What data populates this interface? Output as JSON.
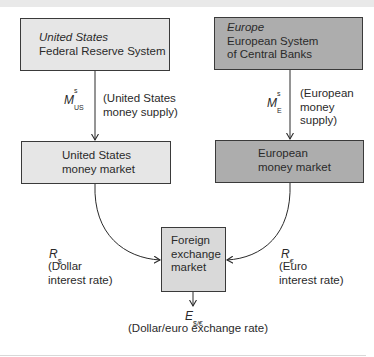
{
  "boxes": {
    "us_fed": {
      "region": "United States",
      "name": "Federal Reserve System"
    },
    "europe_escb": {
      "region": "Europe",
      "name_line1": "European System",
      "name_line2": "of Central Banks"
    },
    "us_money_market": {
      "line1": "United States",
      "line2": "money market"
    },
    "eu_money_market": {
      "line1": "European",
      "line2": "money market"
    },
    "fx_market": {
      "line1": "Foreign",
      "line2": "exchange",
      "line3": "market"
    }
  },
  "flows": {
    "us_supply": {
      "symbol": "M",
      "sup": "s",
      "sub": "US",
      "desc_line1": "(United States",
      "desc_line2": "money supply)"
    },
    "eu_supply": {
      "symbol": "M",
      "sup": "s",
      "sub": "E",
      "desc_line1": "(European",
      "desc_line2": "money",
      "desc_line3": "supply)"
    },
    "dollar_rate": {
      "symbol": "R",
      "sub": "$",
      "desc_line1": "(Dollar",
      "desc_line2": "interest rate)"
    },
    "euro_rate": {
      "symbol": "R",
      "sub": "€",
      "desc_line1": "(Euro",
      "desc_line2": "interest rate)"
    },
    "exchange_rate": {
      "symbol": "E",
      "sub": "$/€",
      "desc": "(Dollar/euro exchange rate)"
    }
  },
  "colors": {
    "us_box_fill": "#e6e6e6",
    "eu_box_fill": "#adadad",
    "fx_box_fill": "#d9d9d9",
    "line": "#2a2a2a"
  }
}
